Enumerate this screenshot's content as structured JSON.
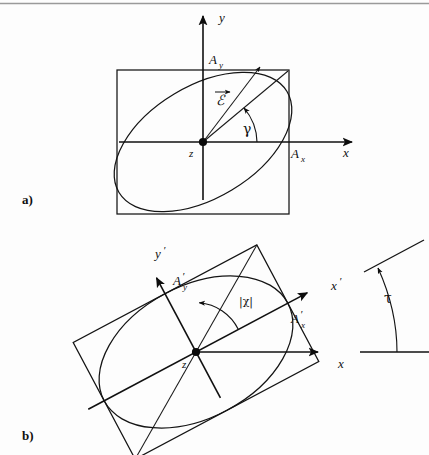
{
  "figure": {
    "kind": "polarization-ellipse-diagram",
    "background_color": "#fdfdfd",
    "line_color": "#141414",
    "top_rule_color": "#9a9a9a"
  },
  "panel_a": {
    "label": "a)",
    "axes": {
      "x_label": "x",
      "y_label": "y",
      "origin_label": "z"
    },
    "amplitudes": {
      "x_label": "A",
      "x_sub": "x",
      "y_label": "A",
      "y_sub": "y"
    },
    "field_vector_label": "ℰ",
    "angle_label": "γ",
    "geometry": {
      "origin_x": 203,
      "origin_y": 142,
      "box_half_width": 86,
      "box_half_height": 72,
      "ellipse_rx": 98,
      "ellipse_ry": 56,
      "ellipse_rotation_deg": -31,
      "diagonal_angle_deg": -40,
      "field_vector_angle_deg": -53,
      "field_vector_length": 94,
      "gamma_arc_radius": 52
    }
  },
  "panel_b": {
    "label": "b)",
    "axes": {
      "x_label": "x",
      "x_prime_label": "x",
      "y_prime_label": "y",
      "origin_label": "z",
      "prime_mark": "′"
    },
    "amplitudes": {
      "x_prime_label": "A",
      "x_prime_sub": "x",
      "y_prime_label": "A",
      "y_prime_sub": "y"
    },
    "ellipticity_label": "|χ|",
    "orientation_label": "τ",
    "geometry": {
      "origin_x": 196,
      "origin_y": 352,
      "rotation_deg": -28,
      "box_half_width": 104,
      "box_half_height": 66,
      "ellipse_rx": 104,
      "ellipse_ry": 66,
      "chi_arc_radius": 48,
      "x_axis_end": 310,
      "tau_baseline_y": 352,
      "tau_pivot_x": 398,
      "tau_tilt_deg": -28
    }
  }
}
